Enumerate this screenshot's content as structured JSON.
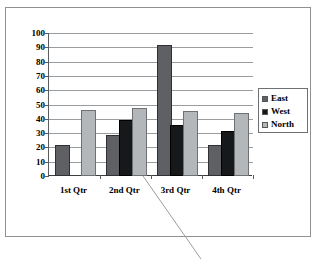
{
  "chart_data": {
    "type": "bar",
    "title": "",
    "subtitle": "",
    "xlabel": "",
    "ylabel": "",
    "categories": [
      "1st Qtr",
      "2nd Qtr",
      "3rd Qtr",
      "4th Qtr"
    ],
    "series": [
      {
        "name": "East",
        "color": "#5e6063",
        "values": [
          20,
          27,
          90,
          20
        ]
      },
      {
        "name": "West",
        "color": "#17181a",
        "values": [
          0,
          38,
          34,
          30
        ]
      },
      {
        "name": "North",
        "color": "#b4b7ba",
        "values": [
          45,
          46,
          44,
          43
        ]
      }
    ],
    "ylim": [
      0,
      100
    ],
    "y_ticks": [
      0,
      10,
      20,
      30,
      40,
      50,
      60,
      70,
      80,
      90,
      100
    ],
    "y_tick_labels": [
      "0",
      "10",
      "20",
      "30",
      "40",
      "50",
      "60",
      "70",
      "80",
      "90",
      "100"
    ],
    "grid": true,
    "grid_axis": "y",
    "legend": true,
    "legend_position": "right"
  },
  "legend": {
    "items": [
      {
        "label": "East",
        "swatch": "legend-swatch-east"
      },
      {
        "label": "West",
        "swatch": "legend-swatch-west"
      },
      {
        "label": "North",
        "swatch": "legend-swatch-north"
      }
    ]
  },
  "annotation": {
    "leader_line": "diagonal-leader-line"
  }
}
